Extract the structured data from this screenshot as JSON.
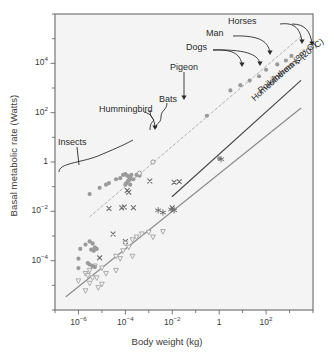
{
  "chart_data": {
    "type": "scatter",
    "title": "",
    "xlabel": "Body weight (kg)",
    "ylabel": "Basal metabolic rate (Watts)",
    "xscale": "log",
    "yscale": "log",
    "xlim": [
      1e-07,
      10000.0
    ],
    "ylim": [
      1e-06,
      1000000.0
    ],
    "grid": false,
    "legend_position": "none",
    "xtick_labels": [
      "10⁻⁶",
      "10⁻⁴",
      "10⁻²",
      "1",
      "10²"
    ],
    "xtick_values": [
      1e-06,
      0.0001,
      0.01,
      1,
      100
    ],
    "ytick_labels": [
      "10⁴",
      "10²",
      "1",
      "10⁻²",
      "10⁻⁴"
    ],
    "ytick_values": [
      10000,
      100,
      1,
      0.01,
      0.0001
    ],
    "minor_ticks_every_decade": true,
    "annotations": [
      {
        "text": "Horses",
        "x": 300,
        "y": 30000
      },
      {
        "text": "Man",
        "x": 70,
        "y": 10000
      },
      {
        "text": "Dogs",
        "x": 10,
        "y": 3000
      },
      {
        "text": "Pigeon",
        "x": 0.3,
        "y": 300
      },
      {
        "text": "Bats",
        "x": 0.003,
        "y": 100
      },
      {
        "text": "Hummingbird",
        "x": 0.0002,
        "y": 30
      },
      {
        "text": "Insects",
        "x": 1e-05,
        "y": 3
      }
    ],
    "reference_lines": [
      {
        "name": "Homeotherms (39° C)",
        "label": "Homeotherms (39° C)",
        "slope": 0.75,
        "color": "#4a4a4a",
        "style": "solid",
        "x_from": 0.01,
        "x_to": 3000,
        "y_from": 0.04,
        "y_to": 2000
      },
      {
        "name": "Poikilotherms (20° C)",
        "label": "Poikilotherms (20° C)",
        "slope": 0.75,
        "color": "#8d8d8d",
        "style": "solid",
        "x_from": 3e-07,
        "x_to": 3000,
        "y_from": 3.5e-06,
        "y_to": 150
      },
      {
        "name": "Homeotherm data fit",
        "label": "",
        "slope": 0.75,
        "color": "#b0b0b0",
        "style": "dashed",
        "x_from": 3e-06,
        "x_to": 3000,
        "y_from": 0.006,
        "y_to": 120000
      }
    ],
    "series": [
      {
        "name": "Homeotherms (birds & mammals)",
        "marker": "filled-circle",
        "color": "#9a9a9a",
        "points": [
          [
            3e-06,
            0.05
          ],
          [
            8e-06,
            0.09
          ],
          [
            1.5e-05,
            0.12
          ],
          [
            2e-05,
            0.14
          ],
          [
            4e-05,
            0.2
          ],
          [
            6e-05,
            0.22
          ],
          [
            8e-05,
            0.3
          ],
          [
            0.0001,
            0.32
          ],
          [
            0.00012,
            0.28
          ],
          [
            0.00014,
            0.25
          ],
          [
            0.00016,
            0.22
          ],
          [
            0.00018,
            0.3
          ],
          [
            0.00013,
            0.17
          ],
          [
            0.00015,
            0.19
          ],
          [
            0.00011,
            0.14
          ],
          [
            0.00022,
            0.2
          ],
          [
            0.0001,
            0.12
          ],
          [
            0.00016,
            0.12
          ],
          [
            0.0003,
            0.3
          ],
          [
            0.0004,
            0.28
          ],
          [
            0.3,
            75
          ],
          [
            1,
            1.4
          ],
          [
            3,
            800
          ],
          [
            8,
            1300
          ],
          [
            20,
            2000
          ],
          [
            50,
            3000
          ],
          [
            100,
            5500
          ],
          [
            300,
            9000
          ],
          [
            700,
            13000
          ],
          [
            1200,
            20000
          ]
        ]
      },
      {
        "name": "Open circle markers",
        "marker": "open-circle",
        "color": "#9a9a9a",
        "points": [
          [
            0.0004,
            0.35
          ],
          [
            0.0015,
            1.0
          ]
        ]
      },
      {
        "name": "Cross markers",
        "marker": "cross",
        "color": "#6e6e6e",
        "points": [
          [
            2e-05,
            0.013
          ],
          [
            7e-05,
            0.014
          ],
          [
            9e-05,
            0.015
          ],
          [
            0.00012,
            0.07
          ],
          [
            0.00014,
            0.06
          ],
          [
            0.00022,
            0.014
          ],
          [
            0.0011,
            0.17
          ],
          [
            0.012,
            0.15
          ],
          [
            0.02,
            0.16
          ],
          [
            0.01,
            0.014
          ],
          [
            8e-06,
            0.00013
          ],
          [
            3e-05,
            0.0012
          ],
          [
            0.0001,
            0.0006
          ]
        ]
      },
      {
        "name": "Star markers",
        "marker": "star",
        "color": "#6e6e6e",
        "points": [
          [
            0.0025,
            0.011
          ],
          [
            0.004,
            0.009
          ],
          [
            0.009,
            0.012
          ],
          [
            0.012,
            0.011
          ],
          [
            1.2,
            1.3
          ]
        ]
      },
      {
        "name": "Poikilotherms (down triangles)",
        "marker": "down-triangle",
        "color": "#a8a8a8",
        "points": [
          [
            1e-06,
            1.5e-05
          ],
          [
            2e-06,
            3e-05
          ],
          [
            2.5e-06,
            2.5e-05
          ],
          [
            3e-06,
            4e-05
          ],
          [
            4e-06,
            2e-05
          ],
          [
            5e-06,
            6e-05
          ],
          [
            3e-06,
            1.2e-05
          ],
          [
            6e-06,
            2e-05
          ],
          [
            1e-05,
            5e-05
          ],
          [
            1.5e-05,
            3e-05
          ],
          [
            4e-05,
            0.00015
          ],
          [
            6e-05,
            0.00012
          ],
          [
            8e-05,
            0.00025
          ],
          [
            0.0001,
            0.0005
          ],
          [
            0.00014,
            0.00035
          ],
          [
            0.0002,
            0.0007
          ],
          [
            0.0003,
            0.0009
          ],
          [
            0.0005,
            0.0012
          ],
          [
            0.001,
            0.0014
          ],
          [
            0.0015,
            0.0009
          ],
          [
            0.0002,
            0.00015
          ],
          [
            4e-05,
            4e-05
          ],
          [
            1e-05,
            1.1e-05
          ],
          [
            2e-06,
            6e-06
          ],
          [
            7e-06,
            8e-06
          ],
          [
            0.004,
            0.0015
          ]
        ]
      },
      {
        "name": "Poikilotherm circles",
        "marker": "filled-circle",
        "color": "#9a9a9a",
        "points": [
          [
            1e-06,
            0.00012
          ],
          [
            2e-06,
            0.00045
          ],
          [
            3e-06,
            0.0006
          ],
          [
            4e-06,
            0.0005
          ],
          [
            5e-06,
            0.00035
          ],
          [
            6e-06,
            0.0003
          ],
          [
            3.5e-06,
            0.00028
          ],
          [
            4.5e-06,
            0.00025
          ],
          [
            1.2e-06,
            0.0003
          ],
          [
            2.5e-06,
            8e-05
          ],
          [
            3e-06,
            7e-05
          ],
          [
            4e-06,
            6e-05
          ],
          [
            5e-06,
            5.5e-05
          ],
          [
            1e-06,
            5e-05
          ]
        ]
      }
    ]
  }
}
